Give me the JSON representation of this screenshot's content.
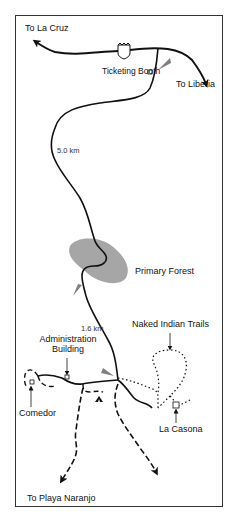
{
  "map": {
    "destinations": {
      "north_west": "To La Cruz",
      "north_east": "To Liberia",
      "south": "To Playa Naranjo"
    },
    "highway_shield": "1",
    "places": {
      "ticketing_booth": "Ticketing Booth",
      "primary_forest": "Primary Forest",
      "naked_indian_trails": "Naked Indian Trails",
      "administration_building_line1": "Administration",
      "administration_building_line2": "Building",
      "comedor": "Comedor",
      "la_casona": "La Casona"
    },
    "distances": {
      "upper_road": "5.0 km",
      "lower_road": "1.6 km"
    },
    "colors": {
      "road": "#111111",
      "forest": "#a6a6a6",
      "marker": "#808080",
      "border": "#333333"
    }
  }
}
